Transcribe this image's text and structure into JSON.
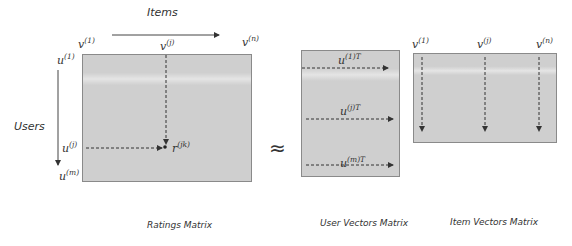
{
  "ratings": {
    "axis_items": "Items",
    "axis_users": "Users",
    "v1": {
      "base": "v",
      "sup": "(1)"
    },
    "vj": {
      "base": "v",
      "sup": "(j)"
    },
    "vn": {
      "base": "v",
      "sup": "(n)"
    },
    "u1": {
      "base": "u",
      "sup": "(1)"
    },
    "uj": {
      "base": "u",
      "sup": "(j)"
    },
    "um": {
      "base": "u",
      "sup": "(m)"
    },
    "rjk": {
      "base": "r",
      "sup": "(jk)"
    },
    "caption": "Ratings Matrix"
  },
  "approx_symbol": "≈",
  "user_vectors": {
    "u1T": {
      "base": "u",
      "sup": "(1)T"
    },
    "ujT": {
      "base": "u",
      "sup": "(j)T"
    },
    "umT": {
      "base": "u",
      "sup": "(m)T"
    },
    "caption": "User Vectors Matrix"
  },
  "item_vectors": {
    "v1": {
      "base": "v",
      "sup": "(1)"
    },
    "vj": {
      "base": "v",
      "sup": "(j)"
    },
    "vn": {
      "base": "v",
      "sup": "(n)"
    },
    "caption": "Item Vectors Matrix"
  },
  "colors": {
    "matrix_fill": "#cfcfcf",
    "matrix_border": "#8a8a8a",
    "arrow": "#333333"
  }
}
